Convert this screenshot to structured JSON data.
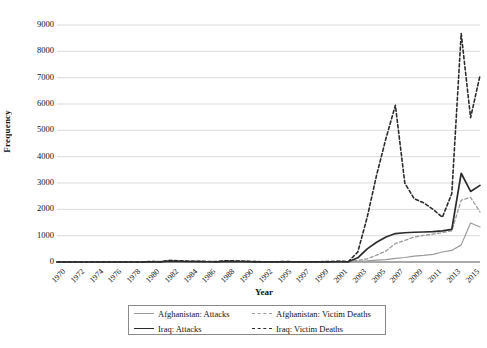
{
  "chart_data": {
    "type": "line",
    "title": "",
    "xlabel": "Year",
    "ylabel": "Frequency",
    "ylim": [
      0,
      9000
    ],
    "ytick_step": 1000,
    "grid": true,
    "legend_position": "bottom",
    "yticks": [
      "0",
      "1000",
      "2000",
      "3000",
      "4000",
      "5000",
      "6000",
      "7000",
      "8000",
      "9000"
    ],
    "categories": [
      "1970",
      "1971",
      "1972",
      "1973",
      "1974",
      "1975",
      "1976",
      "1977",
      "1978",
      "1979",
      "1980",
      "1981",
      "1982",
      "1983",
      "1984",
      "1985",
      "1986",
      "1987",
      "1988",
      "1989",
      "1990",
      "1991",
      "1992",
      "1994",
      "1995",
      "1996",
      "1997",
      "1998",
      "1999",
      "2000",
      "2001",
      "2002",
      "2003",
      "2004",
      "2005",
      "2006",
      "2007",
      "2008",
      "2009",
      "2010",
      "2011",
      "2012",
      "2013",
      "2014",
      "2015",
      "2016"
    ],
    "xtick_labels": [
      "1970",
      "1972",
      "1974",
      "1976",
      "1978",
      "1980",
      "1982",
      "1984",
      "1986",
      "1988",
      "1990",
      "1992",
      "1995",
      "1997",
      "1999",
      "2001",
      "2003",
      "2005",
      "2007",
      "2009",
      "2011",
      "2013",
      "2015"
    ],
    "series": [
      {
        "name": "Afghanistan: Attacks",
        "color": "#9a9a9a",
        "dash": "solid",
        "width": 1.2,
        "values": [
          0,
          0,
          0,
          0,
          0,
          0,
          0,
          0,
          0,
          2,
          10,
          4,
          6,
          8,
          12,
          9,
          7,
          6,
          20,
          18,
          14,
          8,
          6,
          5,
          7,
          6,
          5,
          4,
          6,
          8,
          12,
          10,
          22,
          40,
          70,
          90,
          140,
          170,
          220,
          250,
          290,
          380,
          440,
          650,
          1480,
          1330
        ]
      },
      {
        "name": "Afghanistan: Victim Deaths",
        "color": "#9a9a9a",
        "dash": "dashed",
        "width": 1.3,
        "values": [
          0,
          0,
          0,
          0,
          0,
          0,
          0,
          0,
          0,
          5,
          25,
          10,
          15,
          20,
          30,
          22,
          18,
          14,
          50,
          45,
          35,
          20,
          15,
          12,
          18,
          15,
          12,
          10,
          15,
          20,
          30,
          25,
          60,
          120,
          260,
          420,
          700,
          820,
          950,
          1010,
          1060,
          1120,
          1180,
          2350,
          2450,
          1900
        ]
      },
      {
        "name": "Iraq: Attacks",
        "color": "#2b2b2b",
        "dash": "solid",
        "width": 1.7,
        "values": [
          0,
          0,
          0,
          0,
          0,
          0,
          0,
          0,
          0,
          0,
          8,
          5,
          30,
          20,
          15,
          12,
          10,
          8,
          22,
          18,
          12,
          8,
          5,
          4,
          6,
          5,
          4,
          3,
          5,
          6,
          10,
          8,
          160,
          500,
          750,
          950,
          1080,
          1110,
          1130,
          1140,
          1150,
          1180,
          1240,
          3370,
          2680,
          2910
        ]
      },
      {
        "name": "Iraq: Victim Deaths",
        "color": "#2b2b2b",
        "dash": "dashed",
        "width": 1.6,
        "values": [
          0,
          0,
          0,
          0,
          0,
          0,
          0,
          0,
          0,
          0,
          20,
          12,
          60,
          45,
          30,
          25,
          20,
          15,
          50,
          40,
          25,
          15,
          10,
          8,
          14,
          12,
          10,
          8,
          12,
          15,
          25,
          20,
          380,
          1700,
          3300,
          4700,
          5950,
          3000,
          2400,
          2250,
          2000,
          1700,
          2600,
          8680,
          5480,
          7080
        ]
      }
    ],
    "annotations": []
  },
  "legend": {
    "entries": [
      {
        "label": "Afghanistan: Attacks"
      },
      {
        "label": "Afghanistan: Victim Deaths"
      },
      {
        "label": "Iraq: Attacks"
      },
      {
        "label": "Iraq: Victim Deaths"
      }
    ]
  }
}
